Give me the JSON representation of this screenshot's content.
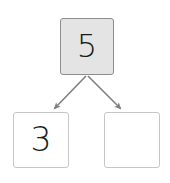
{
  "diagram": {
    "type": "number-bond",
    "background_color": "#ffffff",
    "whole": {
      "label": "whole-box",
      "value": "5",
      "fill_color": "#e4e4e4",
      "border_color": "#8d8d8d",
      "filled": true
    },
    "parts": [
      {
        "label": "part-box-left",
        "value": "3",
        "fill_color": "#ffffff",
        "border_color": "#c6c6c6",
        "filled": true
      },
      {
        "label": "part-box-right",
        "value": "",
        "fill_color": "#ffffff",
        "border_color": "#c6c6c6",
        "filled": false
      }
    ],
    "connectors": [
      {
        "label": "arrow-to-left-part",
        "from": "whole-box",
        "to": "part-box-left",
        "color": "#808080",
        "direction": "down-left"
      },
      {
        "label": "arrow-to-right-part",
        "from": "whole-box",
        "to": "part-box-right",
        "color": "#808080",
        "direction": "down-right"
      }
    ]
  }
}
